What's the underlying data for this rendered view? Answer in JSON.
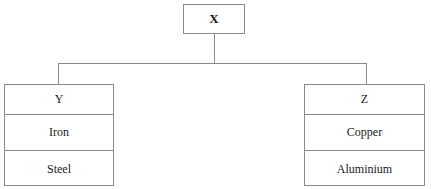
{
  "diagram": {
    "type": "hierarchy-tree",
    "root": {
      "label": "X"
    },
    "children": [
      {
        "id": "left",
        "header": "Y",
        "items": [
          "Iron",
          "Steel"
        ]
      },
      {
        "id": "right",
        "header": "Z",
        "items": [
          "Copper",
          "Aluminium"
        ]
      }
    ],
    "style": {
      "border_color": "#8a8a8a",
      "background_color": "#ffffff",
      "text_color": "#1a1a1a"
    }
  }
}
